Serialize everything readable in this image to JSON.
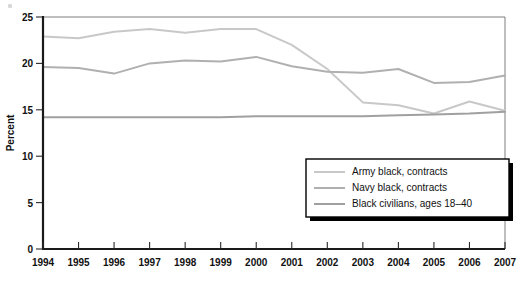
{
  "chart_data": {
    "type": "line",
    "title": "",
    "xlabel": "",
    "ylabel": "Percent",
    "xlim": [
      1994,
      2007
    ],
    "ylim": [
      0,
      25
    ],
    "ytick_labels": [
      "0",
      "5",
      "10",
      "15",
      "20",
      "25"
    ],
    "ytick_values": [
      0,
      5,
      10,
      15,
      20,
      25
    ],
    "grid": false,
    "legend_position": "lower-right",
    "categories": [
      "1994",
      "1995",
      "1996",
      "1997",
      "1998",
      "1999",
      "2000",
      "2001",
      "2002",
      "2003",
      "2004",
      "2005",
      "2006",
      "2007"
    ],
    "x": [
      1994,
      1995,
      1996,
      1997,
      1998,
      1999,
      2000,
      2001,
      2002,
      2003,
      2004,
      2005,
      2006,
      2007
    ],
    "series": [
      {
        "name": "Army black, contracts",
        "color": "#c8c8c8",
        "values": [
          22.9,
          22.7,
          23.4,
          23.7,
          23.3,
          23.7,
          23.7,
          22.0,
          19.4,
          15.8,
          15.5,
          14.6,
          15.9,
          14.9
        ]
      },
      {
        "name": "Navy black, contracts",
        "color": "#b0b0b0",
        "values": [
          19.6,
          19.5,
          18.9,
          20.0,
          20.3,
          20.2,
          20.7,
          19.7,
          19.1,
          19.0,
          19.4,
          17.9,
          18.0,
          18.7
        ]
      },
      {
        "name": "Black civilians, ages 18–40",
        "color": "#a0a0a0",
        "values": [
          14.2,
          14.2,
          14.2,
          14.2,
          14.2,
          14.2,
          14.3,
          14.3,
          14.3,
          14.3,
          14.4,
          14.5,
          14.6,
          14.8
        ]
      }
    ]
  },
  "axes": {
    "y_title": "Percent",
    "y_ticks": [
      "25",
      "20",
      "15",
      "10",
      "5",
      "0"
    ],
    "x_ticks": [
      "1994",
      "1995",
      "1996",
      "1997",
      "1998",
      "1999",
      "2000",
      "2001",
      "2002",
      "2003",
      "2004",
      "2005",
      "2006",
      "2007"
    ]
  },
  "legend": {
    "items": [
      {
        "label": "Army black, contracts",
        "color": "#c8c8c8"
      },
      {
        "label": "Navy black, contracts",
        "color": "#b0b0b0"
      },
      {
        "label": "Black civilians, ages 18–40",
        "color": "#a0a0a0"
      }
    ]
  },
  "colors": {
    "background": "#ffffff",
    "axis": "#1a1a1a",
    "frame": "#6f6f6f",
    "text": "#111111",
    "legend_border": "#000000",
    "legend_shadow": "#000000"
  }
}
